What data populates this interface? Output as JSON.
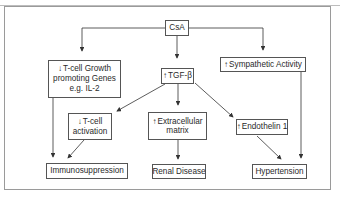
{
  "diagram": {
    "nodes": {
      "csa": {
        "label": "CsA"
      },
      "tcell_growth": {
        "arrow": "↓",
        "line1": "T-cell Growth",
        "line2": "promoting Genes",
        "line3": "e.g. IL-2"
      },
      "tgf": {
        "arrow": "↑",
        "label": "TGF-β"
      },
      "sympathetic": {
        "arrow": "↑",
        "label": "Sympathetic Activity"
      },
      "tcell_activation": {
        "arrow": "↓",
        "line1": "T-cell",
        "line2": "activation"
      },
      "ecm": {
        "arrow": "↑",
        "line1": "Extracellular",
        "line2": "matrix"
      },
      "endothelin": {
        "arrow": "↑",
        "label": "Endothelin 1"
      },
      "immunosuppression": {
        "label": "Immunosuppression"
      },
      "renal": {
        "label": "Renal Disease"
      },
      "hypertension": {
        "label": "Hypertension"
      }
    },
    "edges": [
      [
        "CsA",
        "T-cell Growth promoting Genes"
      ],
      [
        "CsA",
        "TGF-β"
      ],
      [
        "CsA",
        "Sympathetic Activity"
      ],
      [
        "T-cell Growth promoting Genes",
        "Immunosuppression"
      ],
      [
        "TGF-β",
        "T-cell activation"
      ],
      [
        "TGF-β",
        "Extracellular matrix"
      ],
      [
        "TGF-β",
        "Endothelin 1"
      ],
      [
        "T-cell activation",
        "Immunosuppression"
      ],
      [
        "Extracellular matrix",
        "Renal Disease"
      ],
      [
        "Endothelin 1",
        "Hypertension"
      ],
      [
        "Sympathetic Activity",
        "Hypertension"
      ]
    ]
  }
}
